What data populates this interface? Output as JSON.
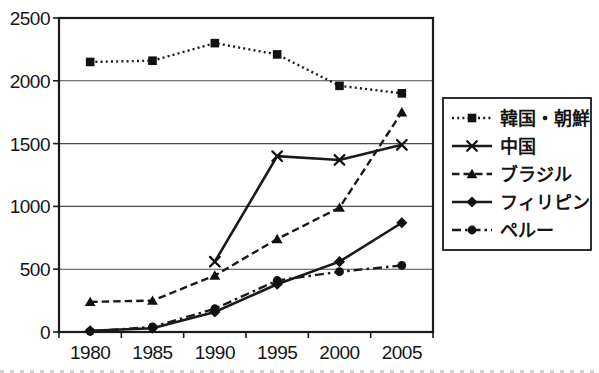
{
  "figure": {
    "background": "#ffffff",
    "ink": "#1a1a1a",
    "grid_color": "#4a4a4a",
    "marker_fill": "#111111"
  },
  "chart_data": {
    "type": "line",
    "title": "",
    "xlabel": "",
    "ylabel": "",
    "x_categories": [
      "1980",
      "1985",
      "1990",
      "1995",
      "2000",
      "2005"
    ],
    "y_ticks": [
      0,
      500,
      1000,
      1500,
      2000,
      2500
    ],
    "ylim": [
      0,
      2500
    ],
    "grid": "horizontal",
    "legend_position": "right",
    "series": [
      {
        "name": "韓国・朝鮮",
        "marker": "square",
        "line_style": "dotted",
        "values": [
          2150,
          2160,
          2300,
          2210,
          1960,
          1900
        ]
      },
      {
        "name": "中国",
        "marker": "x",
        "line_style": "solid",
        "values": [
          null,
          null,
          560,
          1400,
          1370,
          1490
        ]
      },
      {
        "name": "ブラジル",
        "marker": "triangle",
        "line_style": "dashed",
        "values": [
          240,
          250,
          450,
          740,
          990,
          1750
        ]
      },
      {
        "name": "フィリピン",
        "marker": "diamond",
        "line_style": "solid",
        "values": [
          10,
          30,
          160,
          380,
          560,
          870
        ]
      },
      {
        "name": "ペルー",
        "marker": "circle",
        "line_style": "dashdot",
        "values": [
          5,
          40,
          185,
          410,
          480,
          530
        ]
      }
    ]
  }
}
